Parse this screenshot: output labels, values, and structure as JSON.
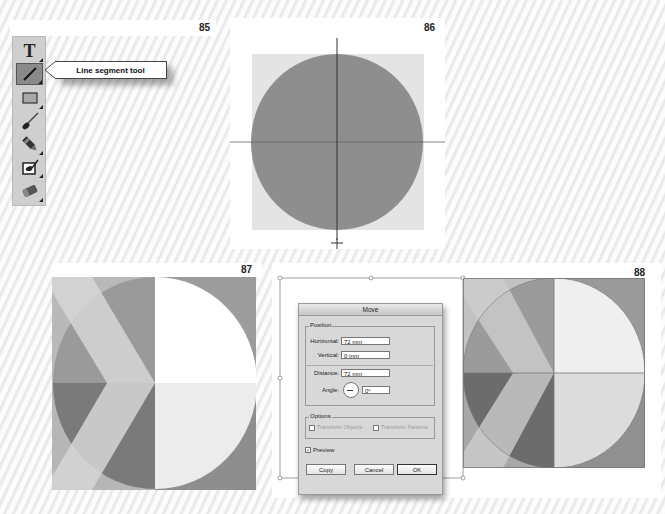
{
  "figures": {
    "fig85": {
      "number": "85"
    },
    "fig86": {
      "number": "86"
    },
    "fig87": {
      "number": "87"
    },
    "fig88": {
      "number": "88"
    }
  },
  "toolbar": {
    "tools": [
      {
        "name": "type-tool",
        "glyph": "T"
      },
      {
        "name": "line-segment-tool",
        "glyph": "/"
      },
      {
        "name": "rectangle-tool",
        "glyph": "▭"
      },
      {
        "name": "paintbrush-tool",
        "glyph": "brush"
      },
      {
        "name": "pencil-tool",
        "glyph": "pencil"
      },
      {
        "name": "shaper-tool",
        "glyph": "shaper"
      },
      {
        "name": "eraser-tool",
        "glyph": "eraser"
      }
    ],
    "active_tool": "line-segment-tool"
  },
  "callout": {
    "label": "Line segment tool"
  },
  "colors": {
    "circle_gray": "#8e8e8e",
    "square_light": "#e2e2e2",
    "dark_gray": "#6e6e6e",
    "mid_gray": "#a4a4a4",
    "light_gray": "#cfcfcf",
    "white": "#ffffff",
    "guide_line": "#555555"
  },
  "move_dialog": {
    "title": "Move",
    "position_group": "Position",
    "horizontal_label": "Horizontal:",
    "horizontal_value": "72 mm",
    "vertical_label": "Vertical:",
    "vertical_value": "0 mm",
    "distance_label": "Distance:",
    "distance_value": "72 mm",
    "angle_label": "Angle:",
    "angle_value": "0°",
    "options_group": "Options",
    "transform_objects_label": "Transform Objects",
    "transform_patterns_label": "Transform Patterns",
    "preview_label": "Preview",
    "preview_checked": true,
    "copy_button": "Copy",
    "cancel_button": "Cancel",
    "ok_button": "OK"
  }
}
